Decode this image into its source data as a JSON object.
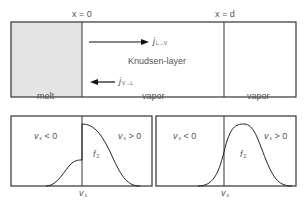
{
  "top": {
    "label_x0": "x = 0",
    "label_xd": "x = d",
    "regions": [
      {
        "label": "melt",
        "fill": "#e4e4e4"
      },
      {
        "label": "vapor",
        "fill": "#ffffff"
      },
      {
        "label": "vapor",
        "fill": "#ffffff"
      }
    ],
    "layer_label": "Knudsen-layer",
    "flux_right": {
      "symbol": "j",
      "subscript": "L→V"
    },
    "flux_left": {
      "symbol": "j",
      "subscript": "V→L"
    }
  },
  "bottom_left": {
    "neg_label": "v",
    "neg_sub": "x",
    "neg_rest": " < 0",
    "pos_label": "v",
    "pos_sub": "x",
    "pos_rest": " > 0",
    "curve_label": "f",
    "curve_sub": "2",
    "axis_label": "v",
    "axis_sub": "x"
  },
  "bottom_right": {
    "neg_label": "v",
    "neg_sub": "x",
    "neg_rest": " < 0",
    "pos_label": "v",
    "pos_sub": "x",
    "pos_rest": " > 0",
    "curve_label": "f",
    "curve_sub": "2",
    "axis_label": "v",
    "axis_sub": "x"
  },
  "colors": {
    "line": "#333333",
    "melt_fill": "#e4e4e4",
    "text": "#555555"
  }
}
